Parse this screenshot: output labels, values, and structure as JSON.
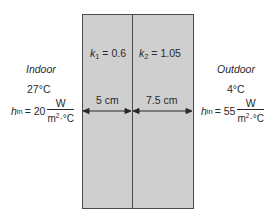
{
  "colors": {
    "wall_fill": "#cfcfcf",
    "wall_border": "#4a4a4a",
    "text": "#2a2a2a",
    "background": "#ffffff"
  },
  "left_side": {
    "label": "Indoor",
    "temperature": "27°C",
    "h_symbol": "h",
    "h_subscript": "in",
    "h_value": "= 20",
    "unit_numerator": "W",
    "unit_denominator": "m",
    "unit_den_sup": "2",
    "unit_den_rest": "·°C"
  },
  "right_side": {
    "label": "Outdoor",
    "temperature": "4°C",
    "h_symbol": "h",
    "h_subscript": "in",
    "h_value": "= 55",
    "unit_numerator": "W",
    "unit_denominator": "m",
    "unit_den_sup": "2",
    "unit_den_rest": "·°C"
  },
  "layers": [
    {
      "k_symbol": "k",
      "k_subscript": "1",
      "k_value": "= 0.6",
      "thickness": "5 cm"
    },
    {
      "k_symbol": "k",
      "k_subscript": "2",
      "k_value": "= 1.05",
      "thickness": "7.5 cm"
    }
  ]
}
